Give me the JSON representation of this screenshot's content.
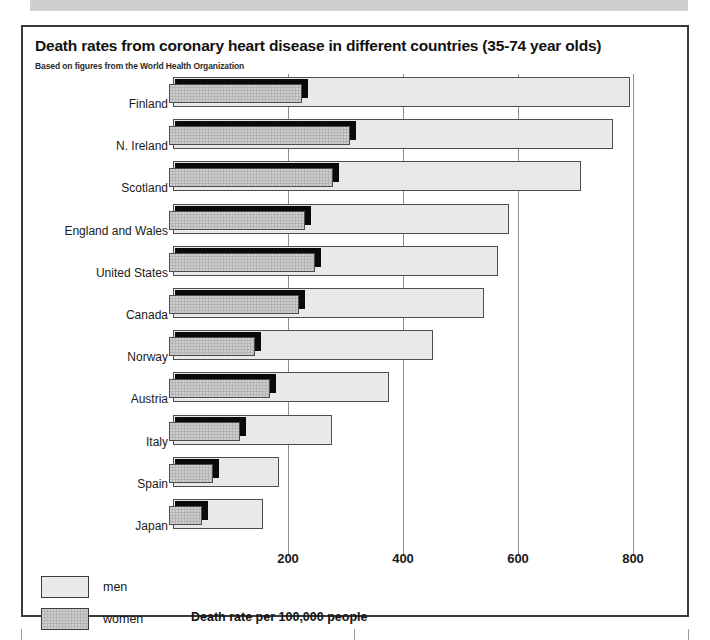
{
  "figure": {
    "title": "Death rates from coronary heart disease in different countries (35-74 year olds)",
    "subtitle": "Based on figures from the World Health Organization",
    "axis_caption": "Death rate per 100,000 people",
    "colors": {
      "men_fill": "#e9e9e9",
      "women_fill": "#b4b4b4",
      "shadow": "#0a0a0a",
      "outline": "#4d4d4d",
      "frame": "#3a3a3a",
      "gridline": "#8d8d8d",
      "text": "#141414"
    }
  },
  "legend": {
    "position": "bottom-left",
    "entries": [
      {
        "label": "men",
        "swatch": "men"
      },
      {
        "label": "women",
        "swatch": "women"
      }
    ]
  },
  "chart_data": {
    "type": "bar",
    "orientation": "horizontal",
    "title": "Death rates from coronary heart disease in different countries (35-74 year olds)",
    "subtitle": "Based on figures from the World Health Organization",
    "xlabel": "Death rate per 100,000 people",
    "ylabel": "",
    "xlim": [
      0,
      850
    ],
    "xticks": [
      200,
      400,
      600,
      800
    ],
    "xticklabels": [
      "200",
      "400",
      "600",
      "800"
    ],
    "grid": "vertical-only",
    "legend_position": "bottom-left",
    "categories": [
      "Finland",
      "N. Ireland",
      "Scotland",
      "England and Wales",
      "United States",
      "Canada",
      "Norway",
      "Austria",
      "Italy",
      "Spain",
      "Japan"
    ],
    "series": [
      {
        "name": "men",
        "values": [
          795,
          765,
          710,
          585,
          565,
          540,
          453,
          376,
          276,
          185,
          157
        ]
      },
      {
        "name": "women",
        "values": [
          217,
          300,
          272,
          222,
          240,
          212,
          136,
          162,
          110,
          63,
          44
        ]
      }
    ]
  }
}
